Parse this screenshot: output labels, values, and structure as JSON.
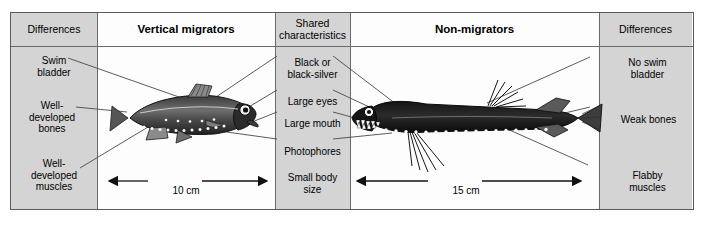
{
  "figure": {
    "type": "comparison-table-diagram"
  },
  "columns": [
    {
      "id": "differences-left",
      "header": "Differences",
      "bold": false,
      "shaded": true
    },
    {
      "id": "vertical-migrators",
      "header": "Vertical migrators",
      "bold": true,
      "shaded": false
    },
    {
      "id": "shared",
      "header": "Shared\ncharacteristics",
      "bold": false,
      "shaded": true
    },
    {
      "id": "non-migrators",
      "header": "Non-migrators",
      "bold": true,
      "shaded": false
    },
    {
      "id": "differences-right",
      "header": "Differences",
      "bold": false,
      "shaded": true
    }
  ],
  "header": {
    "differences_left": "Differences",
    "vertical_migrators": "Vertical migrators",
    "shared_line1": "Shared",
    "shared_line2": "characteristics",
    "non_migrators": "Non-migrators",
    "differences_right": "Differences"
  },
  "left_labels": [
    {
      "id": "swim-bladder",
      "line1": "Swim",
      "line2": "bladder",
      "line3": ""
    },
    {
      "id": "well-developed-bones",
      "line1": "Well-",
      "line2": "developed",
      "line3": "bones"
    },
    {
      "id": "well-developed-muscles",
      "line1": "Well-",
      "line2": "developed",
      "line3": "muscles"
    }
  ],
  "shared_labels": [
    {
      "id": "black-or-black-silver",
      "line1": "Black or",
      "line2": "black-silver",
      "line3": ""
    },
    {
      "id": "large-eyes",
      "line1": "Large eyes",
      "line2": "",
      "line3": ""
    },
    {
      "id": "large-mouth",
      "line1": "Large mouth",
      "line2": "",
      "line3": ""
    },
    {
      "id": "photophores",
      "line1": "Photophores",
      "line2": "",
      "line3": ""
    },
    {
      "id": "small-body-size",
      "line1": "Small body",
      "line2": "size",
      "line3": ""
    }
  ],
  "right_labels": [
    {
      "id": "no-swim-bladder",
      "line1": "No swim",
      "line2": "bladder",
      "line3": ""
    },
    {
      "id": "weak-bones",
      "line1": "Weak bones",
      "line2": "",
      "line3": ""
    },
    {
      "id": "flabby-muscles",
      "line1": "Flabby",
      "line2": "muscles",
      "line3": ""
    }
  ],
  "scales": {
    "left_fish": "10 cm",
    "right_fish": "15 cm"
  },
  "illustrations": {
    "left_fish_name": "lanternfish-illustration",
    "right_fish_name": "dragonfish-illustration"
  },
  "colors": {
    "shaded_column": "#d4d4d4",
    "white_column": "#fdfdfd",
    "border": "#5a5a5a",
    "leader_line": "#4a4a4a",
    "fish_body": "#1c1c1c"
  }
}
